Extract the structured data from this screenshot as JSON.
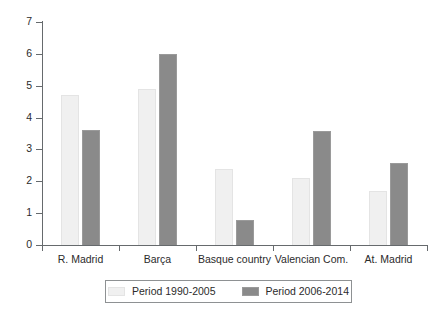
{
  "chart_data": {
    "type": "bar",
    "title": "",
    "xlabel": "",
    "ylabel": "",
    "ylim": [
      0,
      7
    ],
    "yticks": [
      "0",
      "1",
      "2",
      "3",
      "4",
      "5",
      "6",
      "7"
    ],
    "grid": false,
    "legend_position": "bottom",
    "categories": [
      "R. Madrid",
      "Barça",
      "Basque country",
      "Valencian Com.",
      "At. Madrid"
    ],
    "series": [
      {
        "name": "Period 1990-2005",
        "color": "#f0f0f0",
        "values": [
          4.7,
          4.9,
          2.4,
          2.1,
          1.7
        ]
      },
      {
        "name": "Period 2006-2014",
        "color": "#8a8a8a",
        "values": [
          3.6,
          6.0,
          0.78,
          3.58,
          2.57
        ]
      }
    ]
  },
  "legend": {
    "entries": [
      {
        "label": "Period 1990-2005",
        "swatch": "light-swatch-icon"
      },
      {
        "label": "Period 2006-2014",
        "swatch": "dark-swatch-icon"
      }
    ]
  }
}
